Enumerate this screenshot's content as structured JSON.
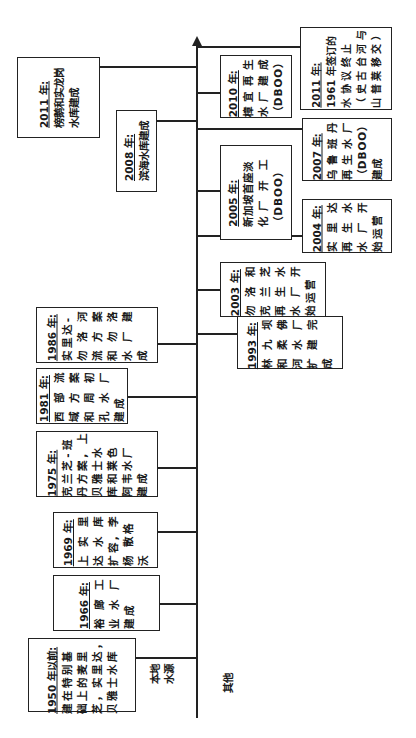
{
  "diagram": {
    "type": "timeline",
    "orientation": "rotated-90-ccw",
    "axis_direction": "time increases upward (toward arrow)",
    "categories": {
      "local": "本地\n水源",
      "other": "其他"
    },
    "local_events": [
      {
        "year": "1950 年以前:",
        "text": "建在特别基\n础上的麦里\n芝，实里达，\n贝雅士水库"
      },
      {
        "year": "1966 年:",
        "text": "裕 廊 工\n业 水 厂\n建成"
      },
      {
        "year": "1969 年:",
        "text": "上 实 里\n达 水 库\n扩容, 李\n杨 散格\n沃"
      },
      {
        "year": "1975 年:",
        "text": "克兰芝-班\n丹方案, 上\n贝雅士水\n库和莱色\n阿韦水厂\n建成"
      },
      {
        "year": "1981 年:",
        "text": "西 部 流\n域 方 案\n和 周 初\n孔 水 厂\n建成"
      },
      {
        "year": "1986 年:",
        "text": "实里达-\n勿 洛 河\n流 方 案\n和 勿 洛\n水 厂 建\n成"
      },
      {
        "year": "2008 年:",
        "text": "滨海水库建成"
      },
      {
        "year": "2011 年:",
        "text": "榜鹅和实龙岗\n水库建成"
      }
    ],
    "other_events": [
      {
        "year": "1993 年:",
        "text": "林 九 坝\n和 柔 佛\n河 水 厂\n扩 建 完\n成"
      },
      {
        "year": "2003 年:",
        "text": "勿 洛 和\n克 兰 芝\n再 生 水\n水 厂 开\n始运营"
      },
      {
        "year": "2004 年:",
        "text": "实 里 达\n再 生 水\n水 厂 开\n始运营"
      },
      {
        "year": "2005 年:",
        "text": "新加坡首座淡\n化 厂  开  工\n（DBOO）"
      },
      {
        "year": "2007 年:",
        "text": "乌 鲁 班 丹\n再 生 水 厂\n（DBOO）\n建成"
      },
      {
        "year": "2010 年:",
        "text": "樟 宜 再 生\n水 厂 建 成\n（DBOO）"
      },
      {
        "year": "2011 年:",
        "text": "1961 年签订的\n水 协 议 终 止\n（ 史 古 台 河 与\n山 普 莱 移 交 ）"
      }
    ]
  }
}
